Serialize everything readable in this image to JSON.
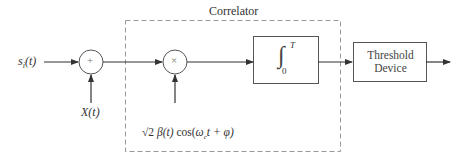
{
  "diagram": {
    "correlator_label": "Correlator",
    "input_signal": "sᵢ(t)",
    "input_signal_base": "s",
    "input_signal_sub": "i",
    "input_signal_arg": "(t)",
    "noise_label": "X(t)",
    "adder_symbol": "+",
    "multiplier_symbol": "×",
    "reference_signal": "√2 β(t) cos(ωᴄt + φ)",
    "reference_parts": {
      "sqrt": "√2",
      "beta": "β(t)",
      "cos": " cos(",
      "omega": "ω",
      "omega_sub": "c",
      "rest": "t + φ)"
    },
    "integrator": {
      "symbol": "∫",
      "lower": "0",
      "upper": "T"
    },
    "threshold_line1": "Threshold",
    "threshold_line2": "Device"
  },
  "colors": {
    "line": "#3a3a3a",
    "dashed": "#9a9a9a",
    "text": "#333333"
  }
}
